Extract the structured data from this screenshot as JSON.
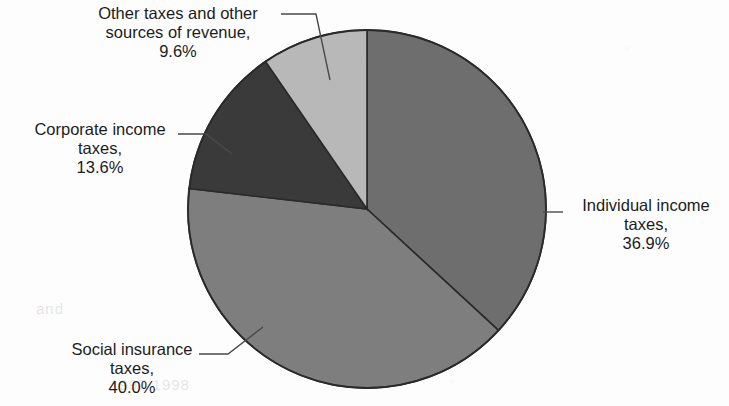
{
  "chart_data": {
    "type": "pie",
    "title": "",
    "categories": [
      "Individual income taxes",
      "Social insurance taxes",
      "Corporate income taxes",
      "Other taxes and other sources of revenue"
    ],
    "values": [
      36.9,
      40.0,
      13.6,
      9.6
    ],
    "value_unit": "%",
    "start_angle_deg": 0,
    "direction": "clockwise",
    "legend": "none",
    "grid": false,
    "colors": [
      "#6e6e6e",
      "#7e7e7e",
      "#3a3a3a",
      "#b8b8b8"
    ],
    "slices": [
      {
        "name": "Individual income taxes",
        "value": 36.9,
        "label_value": "36.9%",
        "color": "#6e6e6e"
      },
      {
        "name": "Social insurance taxes",
        "value": 40.0,
        "label_value": "40.0%",
        "color": "#7e7e7e"
      },
      {
        "name": "Corporate income taxes",
        "value": 13.6,
        "label_value": "13.6%",
        "color": "#3a3a3a"
      },
      {
        "name": "Other taxes and other sources of revenue",
        "value": 9.6,
        "label_value": "9.6%",
        "color": "#b8b8b8"
      }
    ]
  },
  "labels": {
    "other": {
      "line1": "Other taxes and other",
      "line2": "sources of revenue,",
      "line3": "9.6%"
    },
    "corporate": {
      "line1": "Corporate income",
      "line2": "taxes,",
      "line3": "13.6%"
    },
    "social": {
      "line1": "Social insurance",
      "line2": "taxes,",
      "line3": "40.0%"
    },
    "individual": {
      "line1": "Individual income",
      "line2": "taxes,",
      "line3": "36.9%"
    }
  },
  "artifacts": {
    "ghost_a": "1997  1998",
    "ghost_b": "and"
  }
}
